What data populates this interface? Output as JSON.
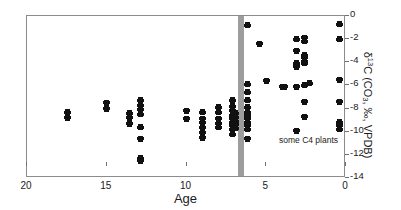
{
  "chart_data": {
    "type": "scatter",
    "title": "",
    "xlabel": "Age",
    "ylabel": "δ13C (CO3, ‰, VPDB)",
    "ylabel_parts": {
      "delta": "δ",
      "superscript": "13",
      "c": "C (CO",
      "sub": "3",
      "tail": ", ‰, VPDB)"
    },
    "xlim": [
      20,
      0
    ],
    "ylim": [
      -14,
      0
    ],
    "x_reversed": true,
    "xticks": [
      20,
      15,
      10,
      5,
      0
    ],
    "xtick_labels": [
      "20",
      "15",
      "10",
      "5",
      "0"
    ],
    "yticks": [
      0,
      -2,
      -4,
      -6,
      -8,
      -10,
      -12,
      -14
    ],
    "ytick_labels": [
      "0",
      "-2",
      "-4",
      "-6",
      "-8",
      "-10",
      "-12",
      "-14"
    ],
    "grid": false,
    "legend": "none",
    "y_axis_side": "right",
    "annotations": [
      {
        "text": "some C4 plants",
        "x": 4.2,
        "y": -10.8,
        "name": "c4-plants-annotation"
      }
    ],
    "bands": [
      {
        "name": "c4-expansion-band",
        "x_start": 6.75,
        "x_end": 6.4,
        "color": "#9d9d9d"
      }
    ],
    "marker": {
      "shape": "diamond",
      "color": "#111111",
      "size": 5
    },
    "points": [
      {
        "x": 17.45,
        "y": -8.3
      },
      {
        "x": 17.45,
        "y": -8.8
      },
      {
        "x": 15.0,
        "y": -7.5
      },
      {
        "x": 15.0,
        "y": -8.0
      },
      {
        "x": 13.6,
        "y": -8.4
      },
      {
        "x": 13.6,
        "y": -8.8
      },
      {
        "x": 13.6,
        "y": -9.3
      },
      {
        "x": 12.9,
        "y": -7.3
      },
      {
        "x": 12.9,
        "y": -7.7
      },
      {
        "x": 12.9,
        "y": -8.1
      },
      {
        "x": 12.9,
        "y": -8.5
      },
      {
        "x": 12.9,
        "y": -9.6
      },
      {
        "x": 12.9,
        "y": -10.6
      },
      {
        "x": 12.9,
        "y": -12.3
      },
      {
        "x": 12.9,
        "y": -12.5
      },
      {
        "x": 10.0,
        "y": -8.2
      },
      {
        "x": 10.0,
        "y": -8.9
      },
      {
        "x": 9.0,
        "y": -8.3
      },
      {
        "x": 9.0,
        "y": -8.9
      },
      {
        "x": 9.0,
        "y": -9.2
      },
      {
        "x": 9.0,
        "y": -9.6
      },
      {
        "x": 9.0,
        "y": -10.1
      },
      {
        "x": 9.0,
        "y": -10.5
      },
      {
        "x": 8.0,
        "y": -7.9
      },
      {
        "x": 8.0,
        "y": -8.3
      },
      {
        "x": 8.0,
        "y": -8.9
      },
      {
        "x": 8.0,
        "y": -9.3
      },
      {
        "x": 8.0,
        "y": -9.6
      },
      {
        "x": 7.1,
        "y": -7.3
      },
      {
        "x": 7.1,
        "y": -7.8
      },
      {
        "x": 7.1,
        "y": -8.2
      },
      {
        "x": 7.1,
        "y": -8.6
      },
      {
        "x": 7.1,
        "y": -8.9
      },
      {
        "x": 7.1,
        "y": -9.2
      },
      {
        "x": 7.1,
        "y": -9.5
      },
      {
        "x": 7.1,
        "y": -9.8
      },
      {
        "x": 7.1,
        "y": -10.2
      },
      {
        "x": 6.9,
        "y": -8.4
      },
      {
        "x": 6.9,
        "y": -8.8
      },
      {
        "x": 6.9,
        "y": -9.1
      },
      {
        "x": 6.9,
        "y": -9.4
      },
      {
        "x": 6.9,
        "y": -9.7
      },
      {
        "x": 6.2,
        "y": -0.8
      },
      {
        "x": 6.2,
        "y": -5.9
      },
      {
        "x": 6.2,
        "y": -6.6
      },
      {
        "x": 6.2,
        "y": -7.3
      },
      {
        "x": 6.2,
        "y": -7.9
      },
      {
        "x": 6.2,
        "y": -8.3
      },
      {
        "x": 6.2,
        "y": -8.6
      },
      {
        "x": 6.2,
        "y": -8.9
      },
      {
        "x": 6.2,
        "y": -9.2
      },
      {
        "x": 6.2,
        "y": -9.5
      },
      {
        "x": 6.2,
        "y": -9.8
      },
      {
        "x": 6.2,
        "y": -10.6
      },
      {
        "x": 5.4,
        "y": -2.4
      },
      {
        "x": 5.0,
        "y": -5.6
      },
      {
        "x": 4.0,
        "y": -6.1
      },
      {
        "x": 3.85,
        "y": -6.1
      },
      {
        "x": 3.1,
        "y": -2.0
      },
      {
        "x": 3.1,
        "y": -3.0
      },
      {
        "x": 3.1,
        "y": -4.1
      },
      {
        "x": 3.1,
        "y": -4.4
      },
      {
        "x": 3.1,
        "y": -6.1
      },
      {
        "x": 3.1,
        "y": -9.9
      },
      {
        "x": 2.6,
        "y": -1.9
      },
      {
        "x": 2.6,
        "y": -2.2
      },
      {
        "x": 2.6,
        "y": -3.4
      },
      {
        "x": 2.6,
        "y": -3.6
      },
      {
        "x": 2.6,
        "y": -3.9
      },
      {
        "x": 2.6,
        "y": -4.1
      },
      {
        "x": 2.6,
        "y": -6.0
      },
      {
        "x": 2.6,
        "y": -7.4
      },
      {
        "x": 2.6,
        "y": -8.7
      },
      {
        "x": 2.3,
        "y": -5.8
      },
      {
        "x": 0.4,
        "y": -0.7
      },
      {
        "x": 0.4,
        "y": -2.0
      },
      {
        "x": 0.4,
        "y": -5.5
      },
      {
        "x": 0.4,
        "y": -7.4
      },
      {
        "x": 0.4,
        "y": -9.2
      },
      {
        "x": 0.4,
        "y": -9.5
      },
      {
        "x": 0.4,
        "y": -9.8
      }
    ]
  }
}
